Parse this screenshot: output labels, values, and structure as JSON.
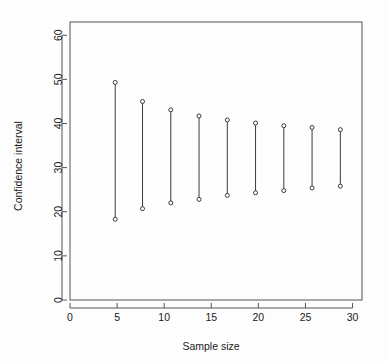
{
  "chart_data": {
    "type": "scatter",
    "title": "",
    "subtitle": "",
    "xlabel": "Sample size",
    "ylabel": "Confidence interval",
    "xlim": [
      0,
      31
    ],
    "ylim": [
      0,
      63
    ],
    "xticks": [
      0,
      5,
      10,
      15,
      20,
      25,
      30
    ],
    "xtick_labels": [
      "0",
      "5",
      "10",
      "15",
      "20",
      "25",
      "30"
    ],
    "yticks": [
      0,
      10,
      20,
      30,
      40,
      50,
      60
    ],
    "ytick_labels": [
      "0",
      "10",
      "20",
      "30",
      "40",
      "50",
      "60"
    ],
    "grid": false,
    "legend": null,
    "legend_position": "none",
    "marker": "open-circle",
    "series_description": "Vertical confidence-interval segments; each segment has an open-circle marker at its lower and upper limit.",
    "x": [
      4.8,
      7.7,
      10.7,
      13.7,
      16.7,
      19.7,
      22.7,
      25.7,
      28.7
    ],
    "lower": [
      18.3,
      20.7,
      22.0,
      22.8,
      23.7,
      24.3,
      24.8,
      25.4,
      25.8
    ],
    "upper": [
      49.3,
      45.0,
      43.1,
      41.7,
      40.8,
      40.1,
      39.5,
      39.1,
      38.6
    ],
    "series": [
      {
        "name": "Lower confidence limit",
        "values": [
          18.3,
          20.7,
          22.0,
          22.8,
          23.7,
          24.3,
          24.8,
          25.4,
          25.8
        ]
      },
      {
        "name": "Upper confidence limit",
        "values": [
          49.3,
          45.0,
          43.1,
          41.7,
          40.8,
          40.1,
          39.5,
          39.1,
          38.6
        ]
      }
    ],
    "widths": [
      31.0,
      24.3,
      21.1,
      18.9,
      17.1,
      15.8,
      14.7,
      13.7,
      12.8
    ],
    "annotations": []
  },
  "style": {
    "line_color": "#3a3a3a",
    "marker_stroke": "#3a3a3a",
    "marker_fill": "#ffffff",
    "axis_color": "#555555",
    "text_color": "#1a1a1a",
    "background": "#fdfdfd"
  }
}
